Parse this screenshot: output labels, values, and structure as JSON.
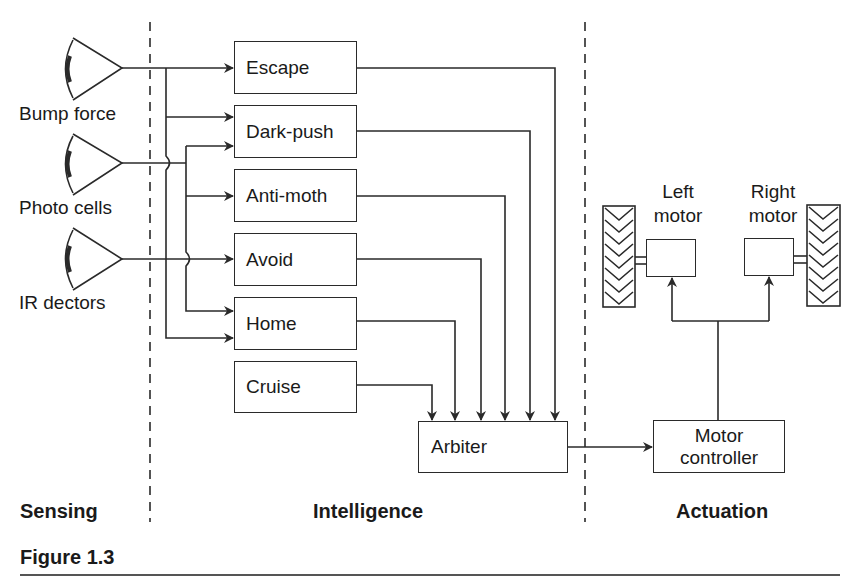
{
  "sensors": [
    {
      "label": "Bump force"
    },
    {
      "label": "Photo cells"
    },
    {
      "label": "IR dectors"
    }
  ],
  "behaviors": [
    {
      "label": "Escape"
    },
    {
      "label": "Dark-push"
    },
    {
      "label": "Anti-moth"
    },
    {
      "label": "Avoid"
    },
    {
      "label": "Home"
    },
    {
      "label": "Cruise"
    }
  ],
  "arbiter": {
    "label": "Arbiter"
  },
  "motor_controller": {
    "label": "Motor controller"
  },
  "motors": {
    "left": {
      "label_line1": "Left",
      "label_line2": "motor"
    },
    "right": {
      "label_line1": "Right",
      "label_line2": "motor"
    }
  },
  "sections": {
    "sensing": "Sensing",
    "intelligence": "Intelligence",
    "actuation": "Actuation"
  },
  "caption": "Figure 1.3",
  "colors": {
    "line": "#2a2a2a",
    "background": "#ffffff"
  }
}
